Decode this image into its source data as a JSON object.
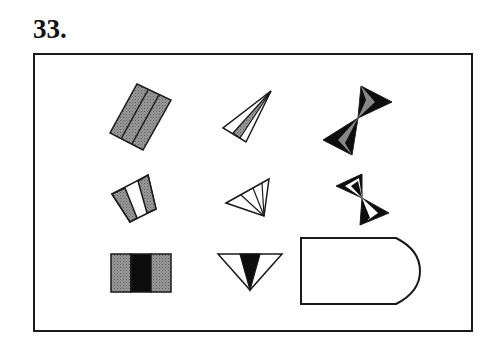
{
  "puzzle": {
    "number_label": "33.",
    "grid": {
      "rows": 3,
      "cols": 3,
      "cells": [
        {
          "row": 1,
          "col": 1,
          "figure": "tilted rectangle divided into three vertical strips, all gray hatched"
        },
        {
          "row": 1,
          "col": 2,
          "figure": "narrow triangle fan divided into three slivers, middle gray"
        },
        {
          "row": 1,
          "col": 3,
          "figure": "bow-tie (two triangles tip-to-tip), black with gray center slivers"
        },
        {
          "row": 2,
          "col": 1,
          "figure": "tilted rectangle divided into three strips: gray, white, gray"
        },
        {
          "row": 2,
          "col": 2,
          "figure": "triangle fan divided into four white slivers"
        },
        {
          "row": 2,
          "col": 3,
          "figure": "bow-tie, black with white center slivers"
        },
        {
          "row": 3,
          "col": 1,
          "figure": "rectangle divided into three strips: gray, black, gray"
        },
        {
          "row": 3,
          "col": 2,
          "figure": "inverted triangle divided into three slivers, middle black"
        },
        {
          "row": 3,
          "col": 3,
          "figure": "blank answer box (rectangle with rounded right end)"
        }
      ]
    },
    "colors": {
      "stroke": "#1a1a1a",
      "gray_fill": "#8c8c8c",
      "black_fill": "#0d0d0d",
      "white_fill": "#ffffff"
    }
  }
}
